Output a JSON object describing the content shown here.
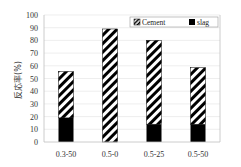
{
  "chart_data": {
    "type": "bar",
    "stacked": true,
    "title": "",
    "xlabel": "",
    "ylabel": "反応率(%)",
    "ylim": [
      0,
      100
    ],
    "yticks": [
      0,
      10,
      20,
      30,
      40,
      50,
      60,
      70,
      80,
      90,
      100
    ],
    "grid": true,
    "legend_position": "top-right",
    "categories": [
      "0.3-50",
      "0.5-0",
      "0.5-25",
      "0.5-50"
    ],
    "series": [
      {
        "name": "slag",
        "pattern": "solid-black",
        "values": [
          19,
          0,
          14,
          14
        ]
      },
      {
        "name": "Cement",
        "pattern": "diagonal-hatch",
        "values": [
          36.5,
          89,
          66,
          44.5
        ]
      }
    ],
    "totals": [
      55.5,
      89,
      80,
      58.5
    ]
  },
  "legend": {
    "items": [
      "Cement",
      "slag"
    ]
  },
  "colors": {
    "slag": "#000000",
    "hatch": "#000000",
    "grid": "#e6e6e6",
    "axis": "#bfbfbf"
  }
}
